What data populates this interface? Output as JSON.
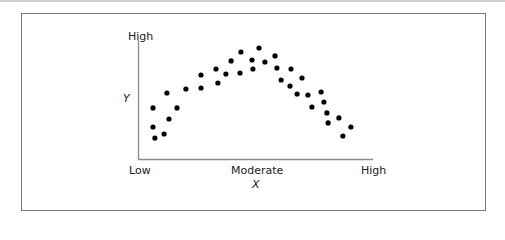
{
  "chart_data": {
    "type": "scatter",
    "title": "",
    "xlabel": "X",
    "ylabel": "Y",
    "x_ticks": [
      "Low",
      "Moderate",
      "High"
    ],
    "y_ticks": [
      "High"
    ],
    "xlim": [
      0,
      100
    ],
    "ylim": [
      0,
      100
    ],
    "grid": false,
    "legend": null,
    "series": [
      {
        "name": "observations",
        "points": [
          [
            6.4,
            42.9
          ],
          [
            6.4,
            26.9
          ],
          [
            7.2,
            17.6
          ],
          [
            11.1,
            21.0
          ],
          [
            13.2,
            33.6
          ],
          [
            16.6,
            42.9
          ],
          [
            12.3,
            55.5
          ],
          [
            20.4,
            58.8
          ],
          [
            26.8,
            59.7
          ],
          [
            26.8,
            70.6
          ],
          [
            33.2,
            75.6
          ],
          [
            34.0,
            63.9
          ],
          [
            37.4,
            71.4
          ],
          [
            39.6,
            82.4
          ],
          [
            43.4,
            72.3
          ],
          [
            43.8,
            89.9
          ],
          [
            48.5,
            83.2
          ],
          [
            48.9,
            75.6
          ],
          [
            51.5,
            93.3
          ],
          [
            54.0,
            81.5
          ],
          [
            58.3,
            86.6
          ],
          [
            59.1,
            76.5
          ],
          [
            60.9,
            66.4
          ],
          [
            65.1,
            75.6
          ],
          [
            64.7,
            61.3
          ],
          [
            69.8,
            68.1
          ],
          [
            67.7,
            54.6
          ],
          [
            72.3,
            53.8
          ],
          [
            77.9,
            56.3
          ],
          [
            74.0,
            43.7
          ],
          [
            79.1,
            47.9
          ],
          [
            80.4,
            38.7
          ],
          [
            80.9,
            30.3
          ],
          [
            85.5,
            34.5
          ],
          [
            90.6,
            26.9
          ],
          [
            87.2,
            19.3
          ]
        ]
      }
    ]
  },
  "labels": {
    "y_high": "High",
    "y_axis": "Y",
    "x_low": "Low",
    "x_moderate": "Moderate",
    "x_high": "High",
    "x_axis": "X"
  },
  "colors": {
    "axis": "#8a8a8a",
    "dot": "#000000",
    "frame": "#7a7a7a"
  }
}
